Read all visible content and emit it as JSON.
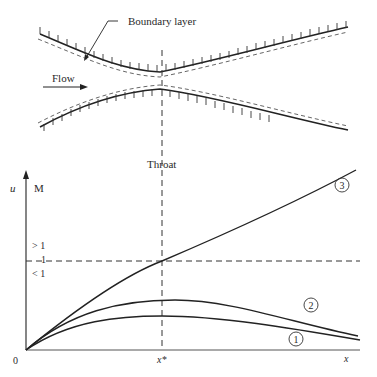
{
  "nozzle": {
    "boundary_layer_label": "Boundary layer",
    "flow_label": "Flow",
    "throat_label": "Throat"
  },
  "plot": {
    "y_axis_label_left": "u",
    "y_axis_label_right": "M",
    "x_axis_label": "x",
    "origin_label": "0",
    "throat_tick_label": "x*",
    "mach_gt_label": "> 1",
    "mach_eq_label": "1",
    "mach_lt_label": "< 1",
    "curve_labels": [
      "1",
      "2",
      "3"
    ]
  },
  "colors": {
    "line": "#222222",
    "dashed": "#333333",
    "background": "#ffffff"
  }
}
